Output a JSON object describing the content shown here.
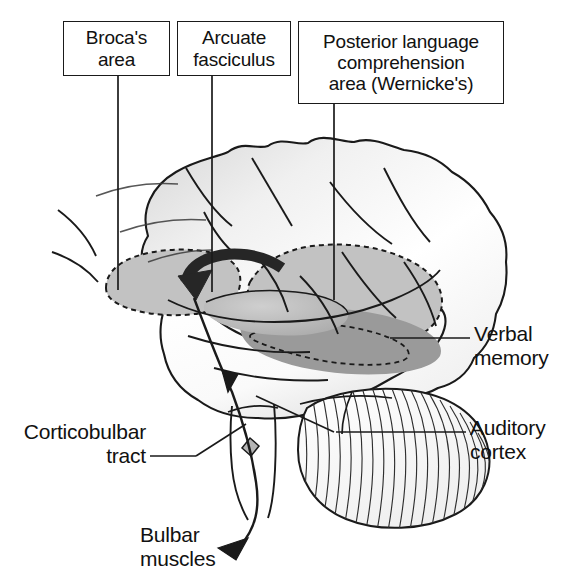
{
  "figure": {
    "palette": {
      "outline": "#1a1a1a",
      "text": "#111111",
      "background": "#ffffff",
      "light_gray_region": "#c2c2c2",
      "dark_gray_region": "#9a9a9a",
      "brain_fill": "#fbfbfb",
      "shadow_gray": "#d8d8d8",
      "arrow_dark": "#262626"
    }
  },
  "callout_boxes": [
    {
      "id": "brocas-area",
      "lines": [
        "Broca's",
        "area"
      ],
      "leader": "vertical line from box down into frontal operculum"
    },
    {
      "id": "arcuate-fasciculus",
      "lines": [
        "Arcuate",
        "fasciculus"
      ],
      "leader": "vertical line from box down to the curved arcuate arrow"
    },
    {
      "id": "wernickes-area",
      "lines": [
        "Posterior language",
        "comprehension",
        "area (Wernicke's)"
      ],
      "leader": "vertical line from box down into posterior temporoparietal region"
    }
  ],
  "side_labels": [
    {
      "id": "verbal-memory",
      "lines": [
        "Verbal",
        "memory"
      ],
      "align": "left",
      "leader": "horizontal line to dark gray temporal band"
    },
    {
      "id": "auditory-cortex",
      "lines": [
        "Auditory",
        "cortex"
      ],
      "align": "left",
      "leader": "horizontal line to superior temporal plane"
    },
    {
      "id": "corticobulbar-tract",
      "lines": [
        "Corticobulbar",
        "tract"
      ],
      "align": "right",
      "leader": "angled line to brainstem tract"
    },
    {
      "id": "bulbar-muscles",
      "lines": [
        "Bulbar",
        "muscles"
      ],
      "align": "left",
      "leader": "curved arrow descending from brainstem"
    }
  ],
  "anatomy": {
    "structures": [
      "cerebral hemisphere",
      "frontal lobe",
      "temporal lobe",
      "parietal lobe",
      "occipital lobe",
      "cerebellum",
      "brainstem"
    ],
    "shaded_regions": [
      {
        "name": "Broca's area",
        "shade": "light-gray",
        "outline": "dashed"
      },
      {
        "name": "Wernicke's area",
        "shade": "light-gray",
        "outline": "dashed"
      },
      {
        "name": "Verbal memory band",
        "shade": "dark-gray",
        "outline": "dashed"
      },
      {
        "name": "Auditory cortex plane",
        "shade": "light-gray",
        "outline": "solid"
      }
    ],
    "pathways": [
      {
        "name": "arcuate fasciculus",
        "style": "thick curved arrow",
        "direction": "posterior to anterior"
      },
      {
        "name": "corticobulbar tract",
        "style": "thin curved arrow",
        "direction": "cortex to bulbar muscles"
      }
    ]
  }
}
